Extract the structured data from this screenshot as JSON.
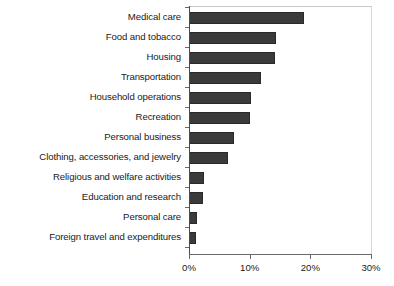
{
  "chart_data": {
    "type": "bar",
    "orientation": "horizontal",
    "title": "",
    "subtitle": "",
    "xlabel": "",
    "ylabel": "",
    "xlim": [
      0,
      30
    ],
    "xunit": "%",
    "grid": false,
    "legend": null,
    "xticks": [
      {
        "value": 0,
        "label": "0%"
      },
      {
        "value": 10,
        "label": "10%"
      },
      {
        "value": 20,
        "label": "20%"
      },
      {
        "value": 30,
        "label": "30%"
      }
    ],
    "categories": [
      "Medical care",
      "Food and tobacco",
      "Housing",
      "Transportation",
      "Household operations",
      "Recreation",
      "Personal business",
      "Clothing, accessories, and jewelry",
      "Religious and welfare activities",
      "Education and research",
      "Personal care",
      "Foreign travel and expenditures"
    ],
    "values": [
      19.0,
      14.3,
      14.2,
      11.9,
      10.3,
      10.1,
      7.4,
      6.4,
      2.5,
      2.3,
      1.4,
      1.2
    ],
    "bar_color": "#3a3a3a",
    "bar_edge_color": "#2a2a2a",
    "axis_color": "#4a4a4a",
    "background_color": "#ffffff"
  }
}
